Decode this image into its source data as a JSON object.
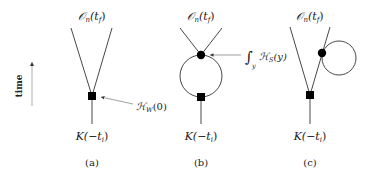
{
  "time_axis": {
    "label": "time"
  },
  "diagrams": [
    {
      "id": "a",
      "caption": "(a)",
      "top_label": {
        "main": "𝒪",
        "sub": "n",
        "arg_open": "(t",
        "arg_sub": "f",
        "arg_close": ")"
      },
      "bottom_label": {
        "main": "K(−t",
        "sub": "i",
        "close": ")"
      },
      "annotation": {
        "main": "ℋ",
        "sub": "W",
        "arg": "(0)"
      }
    },
    {
      "id": "b",
      "caption": "(b)",
      "top_label": {
        "main": "𝒪",
        "sub": "n",
        "arg_open": "(t",
        "arg_sub": "f",
        "arg_close": ")"
      },
      "bottom_label": {
        "main": "K(−t",
        "sub": "i",
        "close": ")"
      },
      "annotation": {
        "integral": "∫",
        "int_sub": "y",
        "main": "ℋ",
        "sub": "S",
        "arg": "(y)"
      }
    },
    {
      "id": "c",
      "caption": "(c)",
      "top_label": {
        "main": "𝒪",
        "sub": "n",
        "arg_open": "(t",
        "arg_sub": "f",
        "arg_close": ")"
      },
      "bottom_label": {
        "main": "K(−t",
        "sub": "i",
        "close": ")"
      }
    }
  ],
  "colors": {
    "line": "#333333",
    "vertex": "#000000",
    "arrow": "#777777"
  }
}
